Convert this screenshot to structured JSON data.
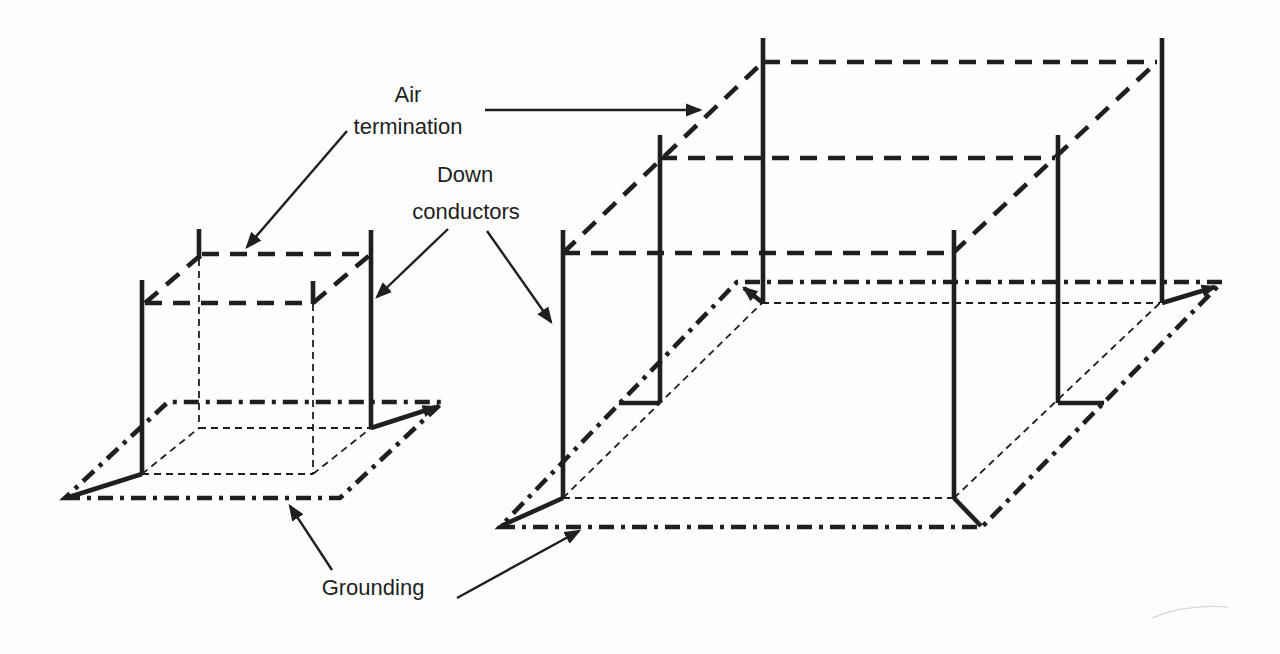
{
  "diagram": {
    "type": "lightning-protection-system-isometric-diagram",
    "labels": {
      "air_termination_line1": "Air",
      "air_termination_line2": "termination",
      "down_conductors_line1": "Down",
      "down_conductors_line2": "conductors",
      "grounding": "Grounding"
    },
    "legend": {
      "air_termination_style": "heavy dashed line (roof edges and roof mesh)",
      "down_conductor_style": "heavy solid vertical line with rod above roof",
      "grounding_style": "heavy dash-dot ring around building base",
      "hidden_edge_style": "thin dashed line (hidden building edges)"
    },
    "structures": [
      {
        "name": "small building",
        "down_conductors": 2,
        "air_rods": 4,
        "roof_mesh_lines": 0
      },
      {
        "name": "large building",
        "down_conductors": 6,
        "air_rods": 6,
        "roof_mesh_lines": 1
      }
    ],
    "colors": {
      "ink": "#1f1f1f",
      "background": "#fdfdfd",
      "smudge": "#c9c9c9"
    }
  }
}
